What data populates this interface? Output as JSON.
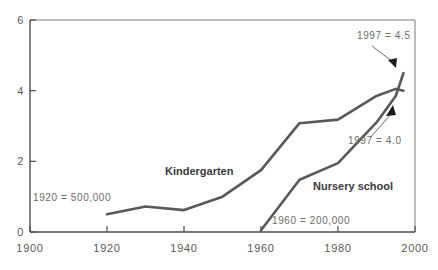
{
  "chart_data": {
    "type": "line",
    "title": "",
    "subtitle": "",
    "xlabel": "",
    "ylabel": "",
    "xlim": [
      1900,
      2000
    ],
    "ylim": [
      0,
      6
    ],
    "x_ticks": [
      1900,
      1920,
      1940,
      1960,
      1980,
      2000
    ],
    "x_tick_labels": [
      "1900",
      "1920",
      "1940",
      "1960",
      "1980",
      "2000"
    ],
    "y_ticks": [
      0,
      2,
      4,
      6
    ],
    "y_tick_labels": [
      "0",
      "2",
      "4",
      "6"
    ],
    "grid": false,
    "legend_position": "inline-labels",
    "series": [
      {
        "name": "Kindergarten",
        "label_text": "Kindergarten",
        "color": "#595959",
        "x": [
          1920,
          1930,
          1940,
          1950,
          1960,
          1970,
          1980,
          1990,
          1995,
          1997
        ],
        "values": [
          0.5,
          0.72,
          0.62,
          1.0,
          1.75,
          3.08,
          3.18,
          3.85,
          4.05,
          4.0
        ]
      },
      {
        "name": "Nursery school",
        "label_text": "Nursery school",
        "color": "#595959",
        "x": [
          1960,
          1970,
          1980,
          1990,
          1995,
          1997
        ],
        "values": [
          0.05,
          1.48,
          1.95,
          3.1,
          3.85,
          4.5
        ]
      }
    ],
    "annotations": [
      {
        "id": "kindergarten-start",
        "text": "1920  =  500,000",
        "x": 1920,
        "y": 0.5
      },
      {
        "id": "nursery-start",
        "text": "1960  =  200,000",
        "x": 1960,
        "y": 0.05
      },
      {
        "id": "nursery-end",
        "text": "1997  =  4.5",
        "x": 1997,
        "y": 4.5,
        "arrow": "down"
      },
      {
        "id": "kindergarten-end",
        "text": "1997  =  4.0",
        "x": 1997,
        "y": 4.0,
        "arrow": "up"
      }
    ]
  },
  "axis": {
    "y_label_6": "6",
    "y_label_4": "4",
    "y_label_2": "2",
    "y_label_0": "0",
    "x_label_1900": "1900",
    "x_label_1920": "1920",
    "x_label_1940": "1940",
    "x_label_1960": "1960",
    "x_label_1980": "1980",
    "x_label_2000": "2000"
  },
  "labels": {
    "kindergarten": "Kindergarten",
    "nursery_school": "Nursery school",
    "annotation_kindergarten_start": "1920  =  500,000",
    "annotation_nursery_start": "1960  =  200,000",
    "annotation_nursery_end": "1997  =  4.5",
    "annotation_kindergarten_end": "1997  =  4.0"
  },
  "colors": {
    "line": "#595959",
    "axis": "#4d4d4d",
    "frame": "#7d7d7d",
    "text": "#5a5a5a",
    "annotation_text": "#6b6b6b",
    "arrow": "#1c1c1c",
    "background": "#ffffff"
  }
}
